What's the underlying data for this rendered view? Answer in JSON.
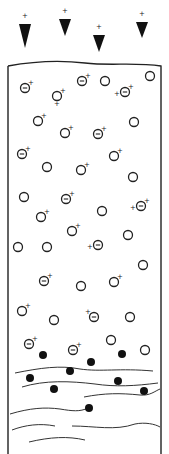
{
  "diagram": {
    "type": "settling-column",
    "colors": {
      "stroke": "#222222",
      "background": "#ffffff",
      "solid_particle": "#111111",
      "layer_line": "#333333",
      "layer_tint": "#4caf50"
    },
    "charge_labels": {
      "positive": "+",
      "negative": "−"
    },
    "incoming_arrows": [
      {
        "x": 25,
        "y": 18,
        "tip": 48
      },
      {
        "x": 65,
        "y": 13,
        "tip": 36
      },
      {
        "x": 99,
        "y": 29,
        "tip": 52
      },
      {
        "x": 142,
        "y": 16,
        "tip": 38
      }
    ],
    "particles": [
      {
        "x": 25,
        "y": 88,
        "type": "neg-core",
        "plus": "tr"
      },
      {
        "x": 82,
        "y": 81,
        "type": "neg-core",
        "plus": "tr"
      },
      {
        "x": 105,
        "y": 81,
        "type": "plain"
      },
      {
        "x": 150,
        "y": 76,
        "type": "plain"
      },
      {
        "x": 57,
        "y": 96,
        "type": "plain",
        "plus": "tr",
        "plus2": "b"
      },
      {
        "x": 125,
        "y": 92,
        "type": "neg-core",
        "plus": "tr",
        "plus2": "l"
      },
      {
        "x": 38,
        "y": 121,
        "type": "plain",
        "plus": "tr"
      },
      {
        "x": 134,
        "y": 122,
        "type": "plain"
      },
      {
        "x": 65,
        "y": 133,
        "type": "plain",
        "plus": "tr"
      },
      {
        "x": 98,
        "y": 134,
        "type": "neg-core",
        "plus": "tr"
      },
      {
        "x": 22,
        "y": 154,
        "type": "neg-core",
        "plus": "tr"
      },
      {
        "x": 114,
        "y": 156,
        "type": "plain",
        "plus": "tr"
      },
      {
        "x": 47,
        "y": 167,
        "type": "plain"
      },
      {
        "x": 81,
        "y": 170,
        "type": "plain",
        "plus": "tr"
      },
      {
        "x": 133,
        "y": 177,
        "type": "plain"
      },
      {
        "x": 24,
        "y": 197,
        "type": "plain"
      },
      {
        "x": 66,
        "y": 199,
        "type": "neg-core",
        "plus": "tr"
      },
      {
        "x": 141,
        "y": 206,
        "type": "neg-core",
        "plus": "tr",
        "plus2": "l"
      },
      {
        "x": 41,
        "y": 217,
        "type": "plain",
        "plus": "tr"
      },
      {
        "x": 102,
        "y": 211,
        "type": "plain"
      },
      {
        "x": 72,
        "y": 231,
        "type": "plain",
        "plus": "tr"
      },
      {
        "x": 128,
        "y": 235,
        "type": "plain"
      },
      {
        "x": 18,
        "y": 247,
        "type": "plain"
      },
      {
        "x": 47,
        "y": 247,
        "type": "plain"
      },
      {
        "x": 98,
        "y": 245,
        "type": "neg-core",
        "plus": "l"
      },
      {
        "x": 143,
        "y": 265,
        "type": "plain"
      },
      {
        "x": 44,
        "y": 281,
        "type": "neg-core",
        "plus": "tr"
      },
      {
        "x": 81,
        "y": 286,
        "type": "plain"
      },
      {
        "x": 114,
        "y": 282,
        "type": "plain",
        "plus": "tr"
      },
      {
        "x": 22,
        "y": 311,
        "type": "plain",
        "plus": "tr"
      },
      {
        "x": 54,
        "y": 320,
        "type": "plain"
      },
      {
        "x": 94,
        "y": 317,
        "type": "neg-core",
        "plus": "tl"
      },
      {
        "x": 130,
        "y": 317,
        "type": "plain"
      },
      {
        "x": 29,
        "y": 344,
        "type": "neg-core",
        "plus": "tr"
      },
      {
        "x": 73,
        "y": 350,
        "type": "neg-core",
        "plus": "tr"
      },
      {
        "x": 111,
        "y": 340,
        "type": "plain"
      },
      {
        "x": 145,
        "y": 350,
        "type": "plain"
      }
    ],
    "solid_particles": [
      {
        "x": 43,
        "y": 355
      },
      {
        "x": 91,
        "y": 362
      },
      {
        "x": 122,
        "y": 354
      },
      {
        "x": 70,
        "y": 371
      },
      {
        "x": 30,
        "y": 378
      },
      {
        "x": 118,
        "y": 381
      },
      {
        "x": 54,
        "y": 389
      },
      {
        "x": 144,
        "y": 391
      },
      {
        "x": 89,
        "y": 408
      }
    ],
    "layers": [
      "M15,373 C40,368 60,365 80,369 C100,372 120,368 153,371",
      "M22,387 C45,380 70,381 95,384 C115,387 135,386 158,383",
      "M84,397 C105,393 120,393 140,395 C150,396 155,391 160,389",
      "M10,414 C30,408 45,407 60,409 C72,411 80,412 88,408",
      "M12,430 C25,425 40,423 55,426",
      "M72,426 C95,426 115,431 135,424 C145,422 155,424 160,427",
      "M29,442 C50,437 68,436 85,440"
    ]
  }
}
